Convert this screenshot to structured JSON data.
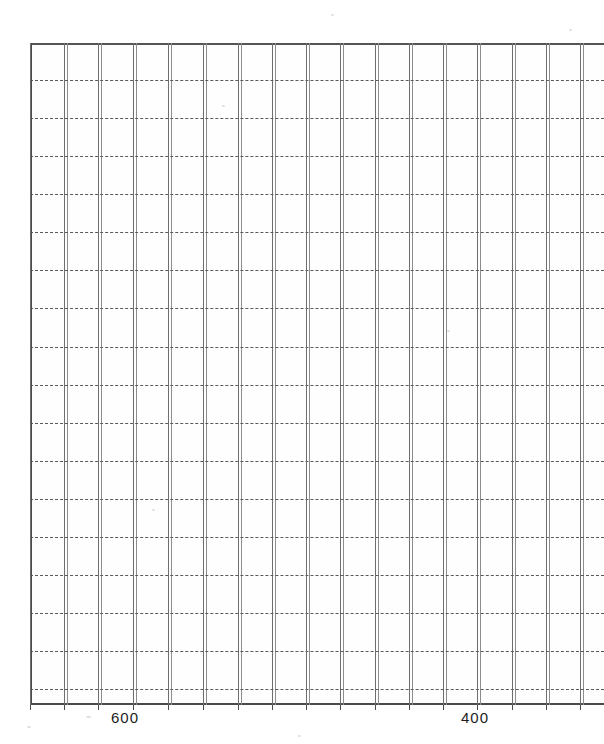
{
  "document": {
    "kind": "scanned-spectrum-grid",
    "background_color": "#ffffff"
  },
  "axis": {
    "line_color": "#4a4a4a",
    "grid_color": "#6e6e6e",
    "dash_color": "#5a5a5a",
    "label_color": "#1d1d1d"
  },
  "labels": {
    "tick_600": "600",
    "tick_400": "400"
  },
  "chart_data": {
    "type": "line",
    "title": "",
    "subtitle": "",
    "xlabel": "",
    "ylabel": "",
    "legend": [],
    "annotations": [],
    "grid": true,
    "legend_position": "none",
    "x": [],
    "series": [
      {
        "name": "spectrum",
        "values": []
      }
    ],
    "xlim": [
      700,
      340
    ],
    "ylim": [
      0,
      100
    ],
    "x_tick_labels": [
      "600",
      "400"
    ],
    "x_tick_values": [
      600,
      400
    ],
    "y_tick_labels": [],
    "x_axis_direction": "decreasing",
    "x_minor_gridlines": 17,
    "y_minor_gridlines": 17,
    "note": "Blank scanned chart grid; no data trace is visible in the plotted region."
  },
  "grid": {
    "vertical_lines": [
      30,
      64,
      98,
      133,
      168,
      203,
      238,
      272,
      306,
      340,
      375,
      409,
      443,
      477,
      512,
      546,
      580
    ],
    "horizontal_lines": [
      80,
      118,
      156,
      194,
      232,
      270,
      308,
      347,
      385,
      423,
      461,
      499,
      537,
      575,
      613,
      651,
      689
    ],
    "ticks": [
      30,
      64,
      98,
      133,
      168,
      203,
      238,
      272,
      306,
      340,
      375,
      409,
      443,
      477,
      512,
      546,
      580
    ],
    "label_positions": [
      {
        "x": 125,
        "text_key": "tick_600"
      },
      {
        "x": 475,
        "text_key": "tick_400"
      }
    ]
  }
}
